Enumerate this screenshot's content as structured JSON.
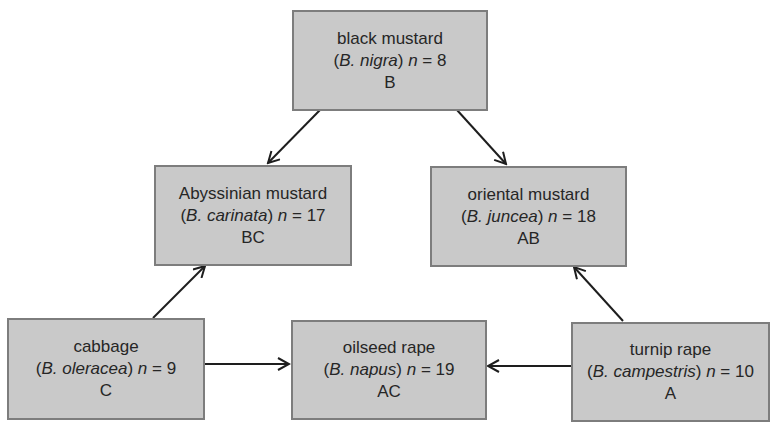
{
  "diagram": {
    "type": "triangle-of-U",
    "nodes": [
      {
        "id": "B",
        "common": "black mustard",
        "genus_abbr": "B.",
        "species": "nigra",
        "n_label": "n",
        "n_value": "8",
        "genome": "B"
      },
      {
        "id": "BC",
        "common": "Abyssinian mustard",
        "genus_abbr": "B.",
        "species": "carinata",
        "n_label": "n",
        "n_value": "17",
        "genome": "BC"
      },
      {
        "id": "AB",
        "common": "oriental mustard",
        "genus_abbr": "B.",
        "species": "juncea",
        "n_label": "n",
        "n_value": "18",
        "genome": "AB"
      },
      {
        "id": "C",
        "common": "cabbage",
        "genus_abbr": "B.",
        "species": "oleracea",
        "n_label": "n",
        "n_value": "9",
        "genome": "C"
      },
      {
        "id": "AC",
        "common": "oilseed rape",
        "genus_abbr": "B.",
        "species": "napus",
        "n_label": "n",
        "n_value": "19",
        "genome": "AC"
      },
      {
        "id": "A",
        "common": "turnip rape",
        "genus_abbr": "B.",
        "species": "campestris",
        "n_label": "n",
        "n_value": "10",
        "genome": "A"
      }
    ],
    "edges": [
      {
        "from": "B",
        "to": "BC"
      },
      {
        "from": "B",
        "to": "AB"
      },
      {
        "from": "C",
        "to": "BC"
      },
      {
        "from": "A",
        "to": "AB"
      },
      {
        "from": "C",
        "to": "AC"
      },
      {
        "from": "A",
        "to": "AC"
      }
    ],
    "colors": {
      "box_fill": "#c9c9c9",
      "box_border": "#7d7d7d",
      "arrow": "#1e1e1e",
      "text": "#262626"
    },
    "equals_sign": "="
  }
}
